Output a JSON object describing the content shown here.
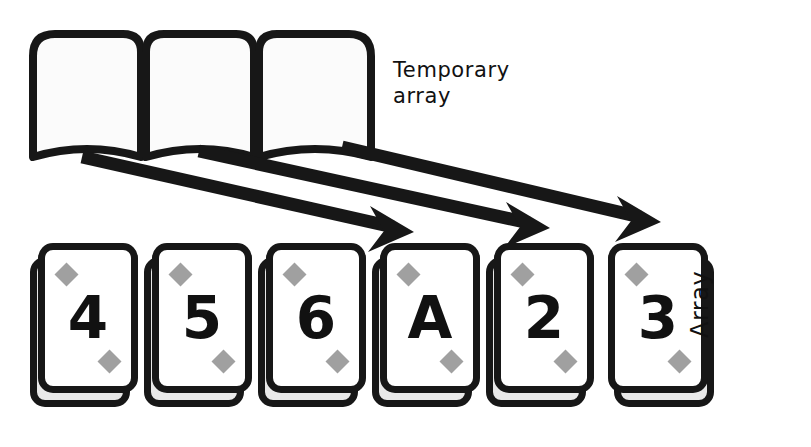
{
  "diagram": {
    "colors": {
      "ink": "#171717",
      "pip_gray": "#a0a0a0",
      "card_face": "#ffffff",
      "card_back": "#e9e9e9",
      "background": "#ffffff"
    }
  },
  "temporary_array": {
    "label": "Temporary\narray",
    "label_line1": "Temporary",
    "label_line2": "array",
    "cell_count": 3,
    "cells": [
      {
        "index": 0,
        "value": ""
      },
      {
        "index": 1,
        "value": ""
      },
      {
        "index": 2,
        "value": ""
      }
    ]
  },
  "array": {
    "label": "Array",
    "cards": [
      {
        "rank": "4",
        "suit": "diamond"
      },
      {
        "rank": "5",
        "suit": "diamond"
      },
      {
        "rank": "6",
        "suit": "diamond"
      },
      {
        "rank": "A",
        "suit": "diamond"
      },
      {
        "rank": "2",
        "suit": "diamond"
      },
      {
        "rank": "3",
        "suit": "diamond"
      }
    ]
  },
  "arrows": [
    {
      "index": 0,
      "from_cell": 0,
      "to_card": 3,
      "x1": 82,
      "y1": 157,
      "x2": 410,
      "y2": 231
    },
    {
      "index": 1,
      "from_cell": 1,
      "to_card": 4,
      "x1": 199,
      "y1": 151,
      "x2": 546,
      "y2": 227
    },
    {
      "index": 2,
      "from_cell": 2,
      "to_card": 5,
      "x1": 342,
      "y1": 147,
      "x2": 657,
      "y2": 221
    }
  ]
}
